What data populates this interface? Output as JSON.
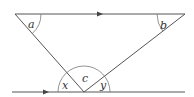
{
  "diagram": {
    "type": "geometry-parallel-lines-triangle",
    "colors": {
      "line": "#555555",
      "arc": "#777777",
      "label": "#333333",
      "background": "#ffffff"
    },
    "labels": {
      "a": "a",
      "b": "b",
      "c": "c",
      "x": "x",
      "y": "y"
    },
    "parallel_markers": [
      "arrow-top",
      "arrow-bottom"
    ]
  }
}
